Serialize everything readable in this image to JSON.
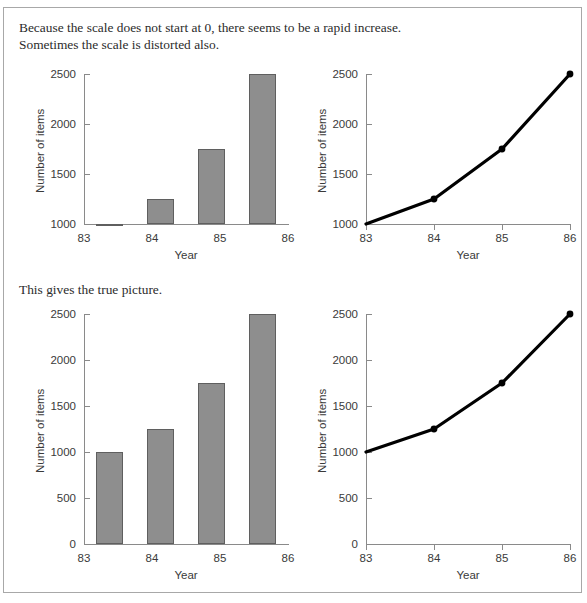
{
  "document": {
    "caption_top": "Because the scale does not start at 0, there seems to be a rapid increase.\nSometimes the scale is distorted also.",
    "caption_middle": "This gives the true picture.",
    "bar_fill_color": "#8e8e8e",
    "bar_border_color": "#5f5f5f",
    "line_color": "#000000",
    "axis_color": "#8a8a8a",
    "frame_color": "#a8a8a8"
  },
  "chart_data": [
    {
      "id": "top-left-bar",
      "type": "bar",
      "title": "",
      "xlabel": "Year",
      "ylabel": "Number of items",
      "categories": [
        "83",
        "84",
        "85",
        "86"
      ],
      "values": [
        1000,
        1250,
        1750,
        2500
      ],
      "yticks": [
        1000,
        1500,
        2000,
        2500
      ],
      "ylim": [
        1000,
        2500
      ],
      "grid": false,
      "legend": "none",
      "note": "truncated y-axis starting at 1000"
    },
    {
      "id": "top-right-line",
      "type": "line",
      "title": "",
      "xlabel": "Year",
      "ylabel": "Number of items",
      "categories": [
        "83",
        "84",
        "85",
        "86"
      ],
      "values": [
        1000,
        1250,
        1750,
        2500
      ],
      "yticks": [
        1000,
        1500,
        2000,
        2500
      ],
      "ylim": [
        1000,
        2500
      ],
      "grid": false,
      "legend": "none",
      "note": "truncated y-axis starting at 1000"
    },
    {
      "id": "bottom-left-bar",
      "type": "bar",
      "title": "",
      "xlabel": "Year",
      "ylabel": "Number of items",
      "categories": [
        "83",
        "84",
        "85",
        "86"
      ],
      "values": [
        1000,
        1250,
        1750,
        2500
      ],
      "yticks": [
        0,
        500,
        1000,
        1500,
        2000,
        2500
      ],
      "ylim": [
        0,
        2500
      ],
      "grid": false,
      "legend": "none",
      "note": "full y-axis starting at 0"
    },
    {
      "id": "bottom-right-line",
      "type": "line",
      "title": "",
      "xlabel": "Year",
      "ylabel": "Number of items",
      "categories": [
        "83",
        "84",
        "85",
        "86"
      ],
      "values": [
        1000,
        1250,
        1750,
        2500
      ],
      "yticks": [
        0,
        500,
        1000,
        1500,
        2000,
        2500
      ],
      "ylim": [
        0,
        2500
      ],
      "grid": false,
      "legend": "none",
      "note": "full y-axis starting at 0"
    }
  ]
}
